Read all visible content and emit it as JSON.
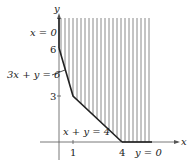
{
  "diagram": {
    "type": "feasible-region",
    "axes": {
      "x_label": "x",
      "y_label": "y",
      "x_ticks": [
        "1",
        "4"
      ],
      "y_ticks": [
        "3",
        "6"
      ]
    },
    "boundary_labels": {
      "x_zero": "x = 0",
      "line1": "3x + y = 6",
      "line2": "x + y = 4",
      "y_zero": "y = 0"
    },
    "vertices": [
      {
        "x": 0,
        "y": 6
      },
      {
        "x": 1,
        "y": 3
      },
      {
        "x": 4,
        "y": 0
      }
    ],
    "region": "shaded unbounded region above 3x+y=6 and x+y=4, x>=0, y>=0",
    "colors": {
      "boundary": "#222222",
      "hatch": "#888888"
    }
  }
}
